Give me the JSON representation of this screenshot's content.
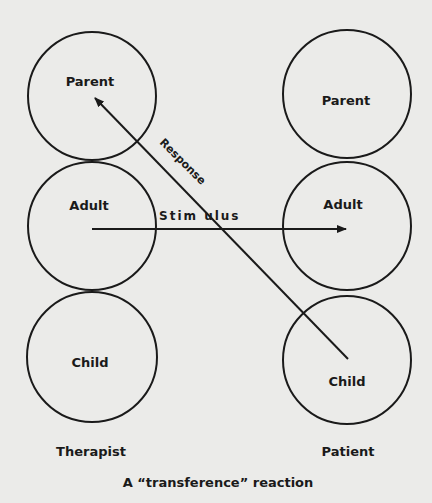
{
  "diagram": {
    "caption": "A “transference” reaction",
    "columns": [
      {
        "name": "Therapist",
        "states": [
          "Parent",
          "Adult",
          "Child"
        ]
      },
      {
        "name": "Patient",
        "states": [
          "Parent",
          "Adult",
          "Child"
        ]
      }
    ],
    "arrows": {
      "stimulus": "Stim ulus",
      "response": "Response"
    },
    "colors": {
      "background": "#ebebe9",
      "ink": "#1a1a1a"
    }
  }
}
